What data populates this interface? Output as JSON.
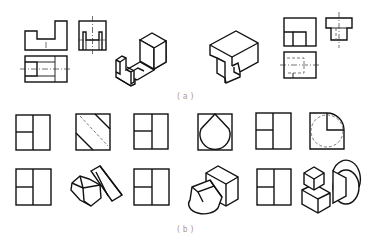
{
  "figure": {
    "captions": {
      "a": "(a)",
      "b": "(b)"
    },
    "part_a": {
      "description": "Orthographic three-view drawings paired with isometric solids",
      "items": [
        {
          "name": "three-view-u-bracket",
          "type": "orthographic-views",
          "views": [
            "front",
            "side",
            "top"
          ]
        },
        {
          "name": "isometric-u-bracket",
          "type": "isometric-solid"
        },
        {
          "name": "isometric-notched-block",
          "type": "isometric-solid"
        },
        {
          "name": "three-view-notched-block",
          "type": "orthographic-views",
          "views": [
            "front",
            "side",
            "top"
          ]
        }
      ]
    },
    "part_b": {
      "description": "Front views (top row) and corresponding isometric/projection views (bottom row)",
      "row1": [
        {
          "name": "front-view-1",
          "type": "square-split"
        },
        {
          "name": "view-diagonal-stripes",
          "type": "square-diagonal"
        },
        {
          "name": "front-view-2",
          "type": "square-split"
        },
        {
          "name": "view-circle-in-square",
          "type": "square-circle"
        },
        {
          "name": "front-view-3",
          "type": "square-split"
        },
        {
          "name": "view-quarter-round",
          "type": "square-quarter-arc"
        }
      ],
      "row2": [
        {
          "name": "front-view-4",
          "type": "square-split"
        },
        {
          "name": "isometric-hexprism-slab",
          "type": "isometric-solid"
        },
        {
          "name": "front-view-5",
          "type": "square-split"
        },
        {
          "name": "isometric-cylinder-block",
          "type": "isometric-solid"
        },
        {
          "name": "front-view-6",
          "type": "square-split"
        },
        {
          "name": "isometric-cubes-cylinder",
          "type": "isometric-solid"
        }
      ]
    },
    "colors": {
      "line": "#111111",
      "caption": "#b59a86",
      "background": "#ffffff"
    }
  }
}
